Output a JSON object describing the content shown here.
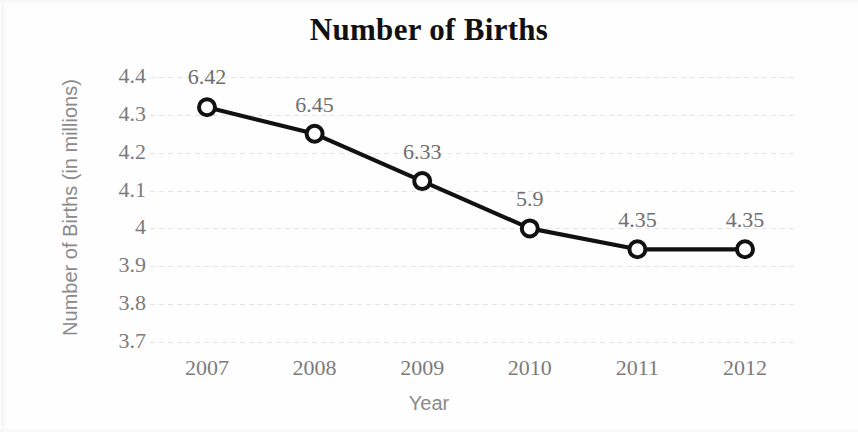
{
  "chart_data": {
    "type": "line",
    "title": "Number of Births",
    "xlabel": "Year",
    "ylabel": "Number of Births (in millions)",
    "categories": [
      "2007",
      "2008",
      "2009",
      "2010",
      "2011",
      "2012"
    ],
    "values": [
      4.32,
      4.25,
      4.125,
      4.0,
      3.945,
      3.945
    ],
    "point_labels": [
      "6.42",
      "6.45",
      "6.33",
      "5.9",
      "4.35",
      "4.35"
    ],
    "ylim": [
      3.7,
      4.4
    ],
    "yticks": [
      "4.4",
      "4.3",
      "4.2",
      "4.1",
      "4",
      "3.9",
      "3.8",
      "3.7"
    ],
    "ytick_values": [
      4.4,
      4.3,
      4.2,
      4.1,
      4.0,
      3.9,
      3.8,
      3.7
    ],
    "grid": true,
    "legend": false,
    "series": [
      {
        "name": "Number of Births",
        "values": [
          4.32,
          4.25,
          4.125,
          4.0,
          3.945,
          3.945
        ],
        "labels": [
          "6.42",
          "6.45",
          "6.33",
          "5.9",
          "4.35",
          "4.35"
        ],
        "line_color": "#111111",
        "marker": "open-circle",
        "marker_face_color": "#ffffff"
      }
    ],
    "colors": {
      "line": "#111111",
      "grid": "#e3e3e3",
      "tick_text": "#7b7b7b",
      "axis_title_text": "#8a8a8a",
      "title_text": "#111111",
      "background": "#ffffff"
    }
  }
}
